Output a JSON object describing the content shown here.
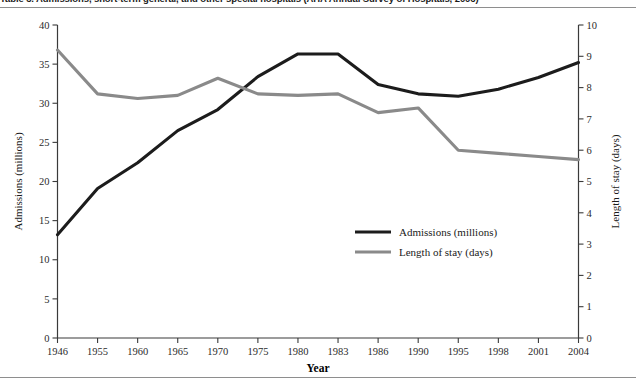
{
  "figure": {
    "title": "Table 3. Admissions, short-term general, and other special hospitals   (AHA Annual Survey of Hospitals, 2006)",
    "x_axis_title": "Year",
    "left_axis_title": "Admissions (millions)",
    "right_axis_title": "Length of stay (days)"
  },
  "legend": {
    "position": "center-right",
    "entries": [
      {
        "label": "Admissions (millions)",
        "color": "#1c1c1c"
      },
      {
        "label": "Length of stay (days)",
        "color": "#8a8a8a"
      }
    ]
  },
  "chart_data": {
    "type": "line",
    "title": "Table 3. Admissions, short-term general, and other special hospitals   (AHA Annual Survey of Hospitals, 2006)",
    "xlabel": "Year",
    "ylabel": "Admissions (millions)",
    "y2label": "Length of stay (days)",
    "grid": false,
    "legend_position": "center-right",
    "categories": [
      "1946",
      "1955",
      "1960",
      "1965",
      "1970",
      "1975",
      "1980",
      "1983",
      "1986",
      "1990",
      "1995",
      "1998",
      "2001",
      "2004"
    ],
    "x_tick_labels": [
      "1946",
      "1955",
      "1960",
      "1965",
      "1970",
      "1975",
      "1980",
      "1983",
      "1986",
      "1990",
      "1995",
      "1998",
      "2001",
      "2004"
    ],
    "left_y_tick_labels": [
      "0",
      "5",
      "10",
      "15",
      "20",
      "25",
      "30",
      "35",
      "40"
    ],
    "right_y_tick_labels": [
      "0",
      "1",
      "2",
      "3",
      "4",
      "5",
      "6",
      "7",
      "8",
      "9",
      "10"
    ],
    "ylim": [
      0,
      40
    ],
    "y2lim": [
      0,
      10
    ],
    "series": [
      {
        "name": "Admissions (millions)",
        "axis": "left",
        "color": "#1c1c1c",
        "values": [
          13.2,
          19.1,
          22.4,
          26.5,
          29.2,
          33.4,
          36.3,
          36.3,
          32.4,
          31.2,
          30.9,
          31.8,
          33.3,
          35.2
        ]
      },
      {
        "name": "Length of stay (days)",
        "axis": "right",
        "color": "#8a8a8a",
        "values": [
          9.2,
          7.8,
          7.65,
          7.75,
          8.3,
          7.8,
          7.75,
          7.8,
          7.2,
          7.35,
          6.0,
          5.9,
          5.8,
          5.7
        ]
      }
    ]
  }
}
